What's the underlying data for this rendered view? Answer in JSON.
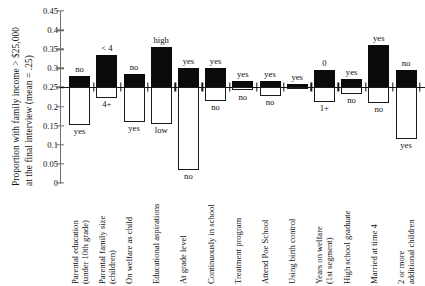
{
  "chart_data": {
    "type": "bar",
    "title": "",
    "subtitle": "",
    "xlabel": "",
    "ylabel": "Proportion with family income > $25,000 at the final interview (mean = .25)",
    "ylabel_lines": [
      "Proportion with family income > $25,000",
      "at the final interview (mean = .25)"
    ],
    "ylim": [
      0,
      0.45
    ],
    "ytick_labels": [
      "0",
      "0.05",
      "0.1",
      "0.15",
      "0.2",
      "0.25",
      "0.3",
      "0.35",
      "0.4",
      "0.45"
    ],
    "ytick_values": [
      0,
      0.05,
      0.1,
      0.15,
      0.2,
      0.25,
      0.3,
      0.35,
      0.4,
      0.45
    ],
    "grid": false,
    "legend": "none",
    "reference_line": 0.25,
    "reference_line_note": "mean = .25",
    "categories": [
      "Parental education (under 10th grade)",
      "Parental family size (children)",
      "On welfare as child",
      "Educational aspirations",
      "At grade level",
      "Continuously in school",
      "Treatment program",
      "Attend Poe School",
      "Using birth control",
      "Years on welfare (1st segment)",
      "High school graduate",
      "Married at time 4",
      "2 or more additional children"
    ],
    "category_label_lines": [
      [
        "Parental education",
        "(under 10th grade)"
      ],
      [
        "Parental family size",
        "(children)"
      ],
      [
        "On welfare as child"
      ],
      [
        "Educational aspirations"
      ],
      [
        "At grade level"
      ],
      [
        "Continuously in school"
      ],
      [
        "Treatment program"
      ],
      [
        "Attend Poe School"
      ],
      [
        "Using birth control"
      ],
      [
        "Years on welfare",
        "(1st segment)"
      ],
      [
        "High school graduate"
      ],
      [
        "Married at time 4"
      ],
      [
        "2 or more",
        "additional children"
      ]
    ],
    "bars": [
      {
        "category": "Parental education (under 10th grade)",
        "upper_value": 0.28,
        "upper_label": "no",
        "lower_value": 0.153,
        "lower_label": "yes"
      },
      {
        "category": "Parental family size (children)",
        "upper_value": 0.335,
        "upper_label": "< 4",
        "lower_value": 0.222,
        "lower_label": "4+"
      },
      {
        "category": "On welfare as child",
        "upper_value": 0.285,
        "upper_label": "no",
        "lower_value": 0.16,
        "lower_label": "yes"
      },
      {
        "category": "Educational aspirations",
        "upper_value": 0.355,
        "upper_label": "high",
        "lower_value": 0.155,
        "lower_label": "low"
      },
      {
        "category": "At grade level",
        "upper_value": 0.3,
        "upper_label": "yes",
        "lower_value": 0.035,
        "lower_label": "no"
      },
      {
        "category": "Continuously in school",
        "upper_value": 0.3,
        "upper_label": "yes",
        "lower_value": 0.215,
        "lower_label": "no"
      },
      {
        "category": "Treatment program",
        "upper_value": 0.266,
        "upper_label": "yes",
        "lower_value": 0.242,
        "lower_label": "no"
      },
      {
        "category": "Attend Poe School",
        "upper_value": 0.268,
        "upper_label": "yes",
        "lower_value": 0.228,
        "lower_label": "no"
      },
      {
        "category": "Using birth control",
        "upper_value": 0.259,
        "upper_label": "yes",
        "lower_value": 0.248,
        "lower_label": ""
      },
      {
        "category": "Years on welfare (1st segment)",
        "upper_value": 0.295,
        "upper_label": "0",
        "lower_value": 0.212,
        "lower_label": "1+"
      },
      {
        "category": "High school graduate",
        "upper_value": 0.272,
        "upper_label": "yes",
        "lower_value": 0.232,
        "lower_label": "no"
      },
      {
        "category": "Married at time 4",
        "upper_value": 0.36,
        "upper_label": "yes",
        "lower_value": 0.21,
        "lower_label": "no"
      },
      {
        "category": "2 or more additional children",
        "upper_value": 0.295,
        "upper_label": "no",
        "lower_value": 0.115,
        "lower_label": "yes"
      }
    ],
    "colors": {
      "upper_fill": "#0b0b0b",
      "lower_fill": "#ffffff",
      "outline": "#1a1a1a",
      "axis": "#6f6f6f"
    }
  }
}
